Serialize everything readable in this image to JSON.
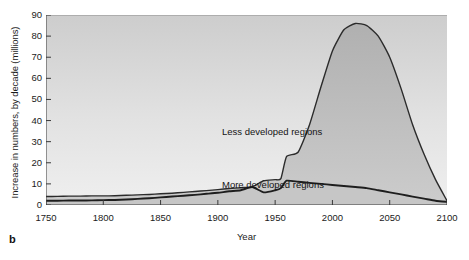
{
  "panel": {
    "letter": "b"
  },
  "axes": {
    "ylabel": "Increase in numbers, by decade (millions)",
    "xlabel": "Year",
    "yticks": [
      "0",
      "10",
      "20",
      "30",
      "40",
      "50",
      "60",
      "70",
      "80",
      "90"
    ],
    "xticks": [
      "1750",
      "1800",
      "1850",
      "1900",
      "1950",
      "2000",
      "2050",
      "2100"
    ]
  },
  "annotations": {
    "less": "Less developed regions",
    "more": "More developed regions"
  },
  "colors": {
    "line": "#2b2b2b",
    "fill_upper": "#b9b9b9",
    "fill_lower": "#c9c9c9",
    "plot_bg_top": "#cfcfcf",
    "plot_bg_bottom": "#ededed",
    "text": "#1b1b1b"
  },
  "chart_data": {
    "type": "area",
    "title": "",
    "xlabel": "Year",
    "ylabel": "Increase in numbers, by decade (millions)",
    "xlim": [
      1750,
      2100
    ],
    "ylim": [
      0,
      90
    ],
    "xticks": [
      1750,
      1800,
      1850,
      1900,
      1950,
      2000,
      2050,
      2100
    ],
    "yticks": [
      0,
      10,
      20,
      30,
      40,
      50,
      60,
      70,
      80,
      90
    ],
    "grid": false,
    "legend_position": "inline-labels-on-curves",
    "x": [
      1750,
      1760,
      1770,
      1780,
      1790,
      1800,
      1810,
      1820,
      1830,
      1840,
      1850,
      1860,
      1870,
      1880,
      1890,
      1900,
      1910,
      1920,
      1930,
      1940,
      1950,
      1955,
      1960,
      1970,
      1980,
      1990,
      2000,
      2010,
      2020,
      2030,
      2040,
      2050,
      2060,
      2070,
      2080,
      2090,
      2100
    ],
    "series": [
      {
        "name": "Less developed regions",
        "label_text": "Less developed regions",
        "values": [
          4.0,
          4.1,
          4.2,
          4.2,
          4.3,
          4.3,
          4.4,
          4.6,
          4.8,
          5.0,
          5.3,
          5.6,
          6.0,
          6.4,
          6.8,
          7.3,
          7.8,
          8.2,
          8.6,
          11.5,
          12.0,
          12.5,
          23.0,
          25.0,
          38.0,
          56.0,
          73.0,
          83.0,
          86.0,
          85.0,
          80.0,
          70.0,
          55.0,
          38.0,
          24.0,
          12.0,
          2.0
        ]
      },
      {
        "name": "More developed regions",
        "label_text": "More developed regions",
        "values": [
          2.0,
          2.0,
          2.1,
          2.1,
          2.2,
          2.3,
          2.4,
          2.6,
          2.9,
          3.2,
          3.6,
          4.0,
          4.4,
          4.8,
          5.3,
          5.8,
          6.5,
          7.0,
          8.5,
          6.0,
          7.0,
          8.0,
          11.5,
          11.0,
          10.5,
          10.0,
          9.5,
          9.0,
          8.5,
          8.0,
          7.0,
          6.0,
          5.0,
          4.0,
          3.0,
          2.0,
          1.5
        ]
      }
    ]
  }
}
